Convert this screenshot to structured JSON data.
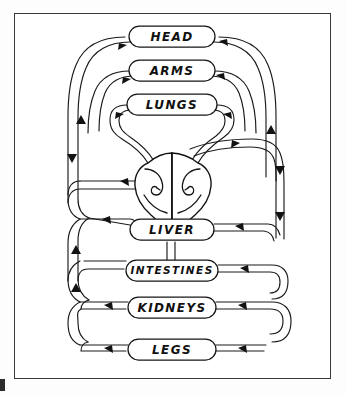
{
  "page": {
    "background_color": "#fdfdfd",
    "frame_color": "#3a3a3a",
    "ink_color": "#121212"
  },
  "diagram": {
    "type": "hand-drawn schematic",
    "organs": [
      {
        "id": "head",
        "label": "HEAD",
        "x": 158,
        "y": 24,
        "w": 86,
        "h": 21,
        "font_size": 12
      },
      {
        "id": "arms",
        "label": "ARMS",
        "x": 158,
        "y": 58,
        "w": 86,
        "h": 21,
        "font_size": 12
      },
      {
        "id": "lungs",
        "label": "LUNGS",
        "x": 158,
        "y": 92,
        "w": 90,
        "h": 21,
        "font_size": 12
      },
      {
        "id": "liver",
        "label": "LIVER",
        "x": 158,
        "y": 217,
        "w": 84,
        "h": 21,
        "font_size": 12
      },
      {
        "id": "intestines",
        "label": "INTESTINES",
        "x": 158,
        "y": 258,
        "w": 92,
        "h": 21,
        "font_size": 11
      },
      {
        "id": "kidneys",
        "label": "KIDNEYS",
        "x": 158,
        "y": 295,
        "w": 88,
        "h": 21,
        "font_size": 12
      },
      {
        "id": "legs",
        "label": "LEGS",
        "x": 158,
        "y": 337,
        "w": 88,
        "h": 21,
        "font_size": 12
      }
    ],
    "heart": {
      "id": "heart",
      "label": "",
      "center_x": 158,
      "center_y": 160,
      "chambers": [
        "left",
        "right"
      ],
      "description": "two-lobed heart with spiral inflow curves at center of diagram"
    },
    "flow": {
      "direction_note": "arrows indicate blood flow around the circuit",
      "arrow_count": 22
    }
  }
}
